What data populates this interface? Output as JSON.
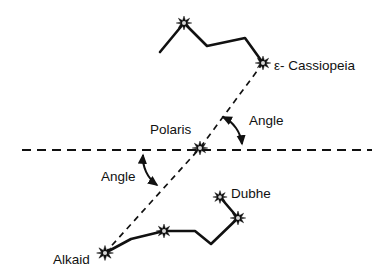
{
  "diagram": {
    "background_color": "#ffffff",
    "line_color": "#111111",
    "labels": {
      "cassiopeia": "ε- Cassiopeia",
      "polaris": "Polaris",
      "dubhe": "Dubhe",
      "alkaid": "Alkaid",
      "angle_upper": "Angle",
      "angle_lower": "Angle"
    },
    "label_positions": {
      "cassiopeia": {
        "x": 274,
        "y": 70
      },
      "polaris": {
        "x": 150,
        "y": 134
      },
      "dubhe": {
        "x": 231,
        "y": 198
      },
      "alkaid": {
        "x": 53,
        "y": 264
      },
      "angle_upper": {
        "x": 249,
        "y": 125
      },
      "angle_lower": {
        "x": 101,
        "y": 181
      }
    },
    "horizon": {
      "name": "horizon-dashed-line",
      "x1": 22,
      "y1": 150,
      "x2": 372,
      "y2": 150
    },
    "sight_line": {
      "name": "polaris-sight-dashed-line",
      "points": "263,63 200,148 105,253"
    },
    "cassiopeia_path": {
      "name": "cassiopeia-w-asterism",
      "points": "160,52 184,23 207,46 245,38 263,63"
    },
    "big_dipper_path": {
      "name": "big-dipper-asterism",
      "points": "105,253 131,239 164,231 195,231 211,244 238,218 220,197"
    },
    "stars": [
      {
        "name": "star-epsilon-cassiopeia",
        "x": 263,
        "y": 63,
        "r": 7
      },
      {
        "name": "star-cassiopeia-peak",
        "x": 184,
        "y": 23,
        "r": 7
      },
      {
        "name": "star-polaris",
        "x": 200,
        "y": 148,
        "r": 7
      },
      {
        "name": "star-dubhe",
        "x": 220,
        "y": 197,
        "r": 6.5
      },
      {
        "name": "star-merak",
        "x": 238,
        "y": 218,
        "r": 7
      },
      {
        "name": "star-alkaid",
        "x": 105,
        "y": 253,
        "r": 7.5
      },
      {
        "name": "star-mizar",
        "x": 164,
        "y": 231,
        "r": 7
      }
    ],
    "angle_arcs": [
      {
        "name": "upper-angle-arc",
        "path": "M 223,117 A 34 34 0 0 1 242,144",
        "arrow_start": {
          "x": 223,
          "y": 117,
          "angle": -128
        },
        "arrow_end": {
          "x": 242,
          "y": 144,
          "angle": 78
        }
      },
      {
        "name": "lower-angle-arc",
        "path": "M 143,155 A 34 34 0 0 0 157,185",
        "arrow_start": {
          "x": 143,
          "y": 155,
          "angle": -80
        },
        "arrow_end": {
          "x": 157,
          "y": 185,
          "angle": 57
        }
      }
    ]
  }
}
